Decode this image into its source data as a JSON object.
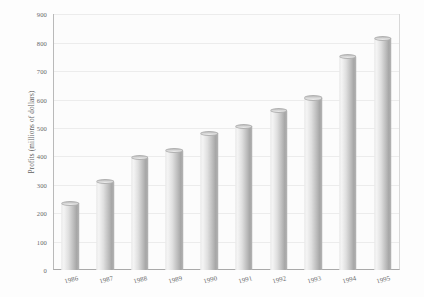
{
  "chart_data": {
    "type": "bar",
    "title": "",
    "xlabel": "",
    "ylabel": "Profits (millions of dollars)",
    "categories": [
      "1986",
      "1987",
      "1988",
      "1989",
      "1990",
      "1991",
      "1992",
      "1993",
      "1994",
      "1995"
    ],
    "values": [
      235,
      310,
      395,
      420,
      480,
      505,
      560,
      605,
      750,
      815
    ],
    "ylim": [
      0,
      900
    ],
    "yticks": [
      0,
      100,
      200,
      300,
      400,
      500,
      600,
      700,
      800,
      900
    ],
    "ytick_labels": [
      "0",
      "100",
      "200",
      "300",
      "400",
      "500",
      "600",
      "700",
      "800",
      "900"
    ],
    "grid": true,
    "legend": false,
    "bar_style": "3d-cylinder",
    "colors": {
      "bar_light": "#f4f4f4",
      "bar_mid": "#dfdfdf",
      "bar_dark": "#a6a6a6",
      "gridline": "#ececec",
      "axis": "#a9a9a9",
      "text": "#6a6a6a",
      "background": "#fdfdfd"
    }
  }
}
